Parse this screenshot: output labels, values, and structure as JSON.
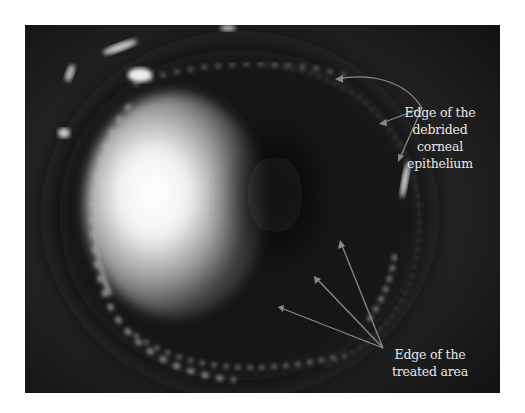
{
  "figure": {
    "annotations": [
      {
        "id": "epithelium-edge",
        "lines": [
          "Edge of the",
          "debrided",
          "corneal",
          "epithelium"
        ],
        "arrow_count": 3
      },
      {
        "id": "treated-area-edge",
        "lines": [
          "Edge of the",
          "treated area"
        ],
        "arrow_count": 3
      }
    ],
    "colors": {
      "background": "#1c1c1c",
      "annotation_text": "#e8e8e8",
      "arrow": "#8a8a8a"
    }
  }
}
